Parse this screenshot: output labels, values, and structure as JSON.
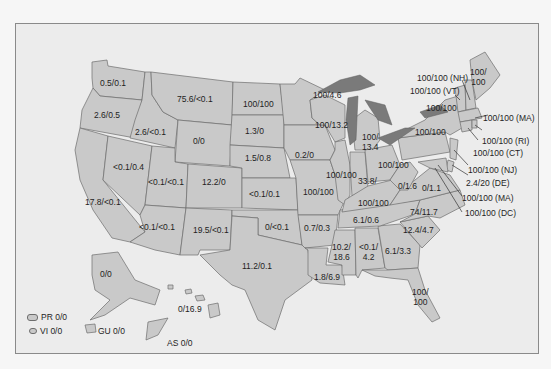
{
  "map": {
    "type": "us-state-choropleth-labels",
    "colors": {
      "background": "#f6f6f6",
      "frame": "#ececec",
      "state_fill": "#c9c9c9",
      "lakes": "#7a7a7a",
      "border": "#6d6d6d"
    },
    "states": {
      "WA": "0.5/0.1",
      "OR": "2.6/0.5",
      "ID": "2.6/<0.1",
      "MT": "75.6/<0.1",
      "WY": "0/0",
      "ND": "100/100",
      "SD": "1.3/0",
      "NE": "1.5/0.8",
      "MN": "100/4.6",
      "WI": "100/13.2",
      "MI_line1": "100/",
      "MI_line2": "13.4",
      "IA": "0.2/0",
      "NV": "<0.1/0.4",
      "UT": "<0.1/<0.1",
      "CO": "12.2/0",
      "KS": "<0.1/0.1",
      "CA": "17.8/<0.1",
      "AZ": "<0.1/<0.1",
      "NM": "19.5/<0.1",
      "OK": "0/<0.1",
      "TX": "11.2/0.1",
      "MO": "100/100",
      "IL": "100/100",
      "IN": "33.8/",
      "OH": "100/100",
      "KY": "100/100",
      "WV": "0/1.6",
      "VA": "0/1.1",
      "PA": "100/100",
      "NY": "100/100",
      "AR": "0.7/0.3",
      "TN": "6.1/0.6",
      "NC": "74/11.7",
      "SC": "12.4/4.7",
      "MS_line1": "10.2/",
      "MS_line2": "18.6",
      "AL_line1": "<0.1/",
      "AL_line2": "4.2",
      "GA": "6.1/3.3",
      "LA": "1.8/6.9",
      "FL_line1": "100/",
      "FL_line2": "100",
      "ME_line1": "100/",
      "ME_line2": "100",
      "AK": "0/0",
      "HI": "0/16.9"
    },
    "callouts": {
      "NH": "100/100 (NH)",
      "VT": "100/100 (VT)",
      "MA": "100/100 (MA)",
      "RI": "100/100 (RI)",
      "CT": "100/100 (CT)",
      "NJ": "100/100 (NJ)",
      "DE": "2.4/20 (DE)",
      "MD": "100/100 (MA)",
      "DC": "100/100 (DC)"
    },
    "territories": {
      "PR": "PR 0/0",
      "VI": "VI 0/0",
      "GU": "GU 0/0",
      "AS": "AS 0/0"
    }
  }
}
